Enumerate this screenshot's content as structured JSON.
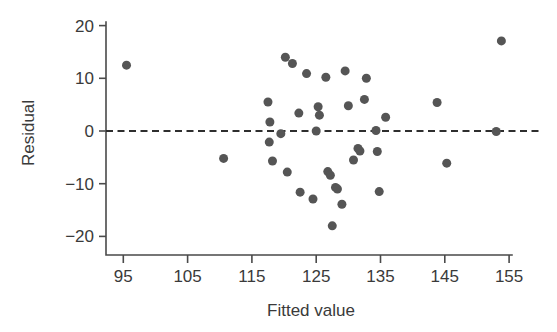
{
  "chart_data": {
    "type": "scatter",
    "title": "",
    "subtitle": "",
    "xlabel": "Fitted value",
    "ylabel": "Residual",
    "xlim": [
      91.0,
      157.5
    ],
    "ylim": [
      -23.0,
      21.5
    ],
    "xticks": [
      95,
      105,
      115,
      125,
      135,
      145,
      155
    ],
    "xtick_labels": [
      "95",
      "105",
      "115",
      "125",
      "135",
      "145",
      "155"
    ],
    "yticks": [
      20,
      10,
      0,
      -10,
      -20
    ],
    "ytick_labels": [
      "20",
      "10",
      "0",
      "−10",
      "−20"
    ],
    "grid": false,
    "legend": null,
    "annotations": [
      {
        "kind": "reference-line",
        "orientation": "horizontal",
        "value": 0,
        "style": "dashed",
        "label": "zero residual line"
      }
    ],
    "marker": {
      "shape": "circle",
      "color": "#555555",
      "size_px": 9
    },
    "series": [
      {
        "name": "residuals",
        "points": [
          [
            95.5,
            12.5
          ],
          [
            110.6,
            -5.2
          ],
          [
            117.5,
            5.5
          ],
          [
            117.8,
            1.7
          ],
          [
            117.7,
            -2.1
          ],
          [
            118.2,
            -5.7
          ],
          [
            119.5,
            -0.5
          ],
          [
            120.2,
            14.0
          ],
          [
            120.5,
            -7.8
          ],
          [
            121.3,
            12.8
          ],
          [
            122.3,
            3.4
          ],
          [
            122.5,
            -11.6
          ],
          [
            123.5,
            10.9
          ],
          [
            124.5,
            -12.9
          ],
          [
            125.0,
            0.0
          ],
          [
            125.3,
            4.6
          ],
          [
            125.5,
            3.0
          ],
          [
            126.5,
            10.2
          ],
          [
            126.8,
            -7.7
          ],
          [
            127.2,
            -8.4
          ],
          [
            127.5,
            -18.0
          ],
          [
            128.0,
            -10.7
          ],
          [
            128.3,
            -11.0
          ],
          [
            129.0,
            -13.9
          ],
          [
            129.5,
            11.4
          ],
          [
            130.0,
            4.8
          ],
          [
            130.8,
            -5.5
          ],
          [
            131.5,
            -3.3
          ],
          [
            131.8,
            -3.8
          ],
          [
            132.5,
            6.0
          ],
          [
            132.8,
            10.0
          ],
          [
            134.3,
            0.1
          ],
          [
            134.5,
            -3.9
          ],
          [
            134.8,
            -11.5
          ],
          [
            135.8,
            2.6
          ],
          [
            143.8,
            5.4
          ],
          [
            145.3,
            -6.1
          ],
          [
            153.0,
            -0.1
          ],
          [
            153.8,
            17.1
          ]
        ]
      }
    ]
  },
  "axes": {
    "x_axis_name": "Fitted value",
    "y_axis_name": "Residual"
  }
}
